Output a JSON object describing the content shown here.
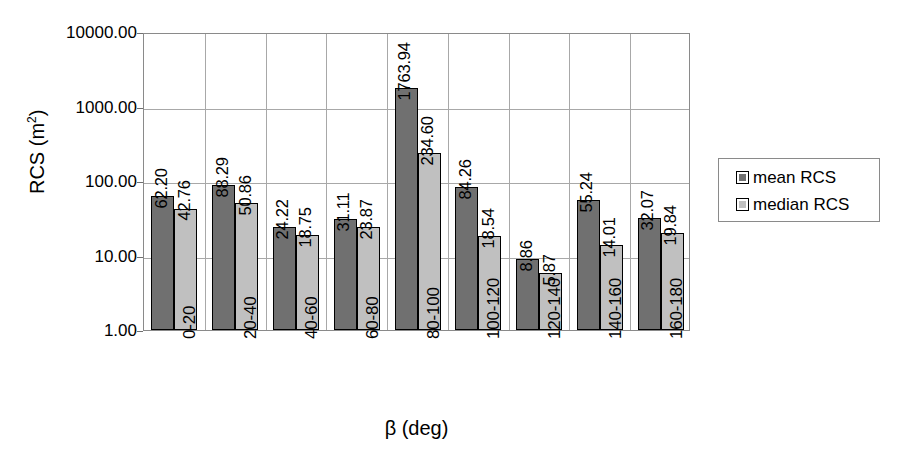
{
  "chart_data": {
    "type": "bar",
    "title": "",
    "xlabel": "β (deg)",
    "ylabel": "RCS (m2)",
    "ylabel_base": "RCS (m",
    "ylabel_exponent": "2",
    "ylabel_close": ")",
    "yscale": "log",
    "ylim": [
      1,
      10000
    ],
    "ytick_labels": [
      "10000.00",
      "1000.00",
      "100.00",
      "10.00",
      "1.00"
    ],
    "ytick_values": [
      10000,
      1000,
      100,
      10,
      1
    ],
    "grid": true,
    "legend_position": "right",
    "categories": [
      "0-20",
      "20-40",
      "40-60",
      "60-80",
      "80-100",
      "100-120",
      "120-140",
      "140-160",
      "160-180"
    ],
    "series": [
      {
        "name": "mean RCS",
        "color": "#707070",
        "values": [
          62.2,
          88.29,
          24.22,
          31.11,
          1763.94,
          84.26,
          8.86,
          55.24,
          32.07
        ],
        "labels": [
          "62.20",
          "88.29",
          "24.22",
          "31.11",
          "1763.94",
          "84.26",
          "8.86",
          "55.24",
          "32.07"
        ]
      },
      {
        "name": "median RCS",
        "color": "#c0c0c0",
        "values": [
          42.76,
          50.86,
          18.75,
          23.87,
          234.6,
          18.54,
          5.87,
          14.01,
          19.84
        ],
        "labels": [
          "42.76",
          "50.86",
          "18.75",
          "23.87",
          "234.60",
          "18.54",
          "5.87",
          "14.01",
          "19.84"
        ]
      }
    ]
  },
  "legend": {
    "items": [
      {
        "label": "mean RCS",
        "color": "#707070"
      },
      {
        "label": "median RCS",
        "color": "#c0c0c0"
      }
    ]
  }
}
